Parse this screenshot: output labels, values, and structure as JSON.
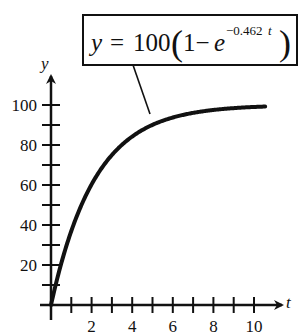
{
  "chart_data": {
    "type": "line",
    "title": "",
    "annotation": {
      "lhs": "y",
      "equals": "=",
      "coef": "100",
      "open_paren": "(",
      "one_minus": "1−",
      "base": "e",
      "exponent": "−0.462",
      "exponent_var": "t",
      "close_paren": ")",
      "full_text": "y = 100(1 − e^(−0.462t))"
    },
    "xlabel": "t",
    "ylabel": "y",
    "xlim": [
      0,
      11
    ],
    "ylim": [
      0,
      110
    ],
    "x_tick_step": 1,
    "y_tick_step": 10,
    "x_tick_labels": [
      "2",
      "4",
      "6",
      "8",
      "10"
    ],
    "y_tick_labels": [
      "20",
      "40",
      "60",
      "80",
      "100"
    ],
    "grid": false,
    "legend": "none",
    "series": [
      {
        "name": "y = 100(1 − e^(−0.462t))",
        "color": "#111111",
        "x": [
          0,
          0.5,
          1,
          1.5,
          2,
          3,
          4,
          5,
          6,
          7,
          8,
          9,
          10,
          10.5
        ],
        "values": [
          0,
          20.6,
          37.0,
          50.0,
          60.3,
          75.0,
          84.2,
          90.1,
          93.7,
          96.1,
          97.5,
          98.4,
          99.0,
          99.2
        ]
      }
    ]
  }
}
